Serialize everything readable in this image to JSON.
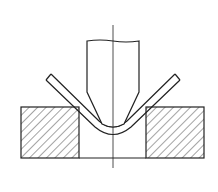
{
  "diagram": {
    "type": "technical-drawing",
    "components": [
      {
        "id": "punch",
        "label": "punch"
      },
      {
        "id": "sheet",
        "label": "bent sheet metal"
      },
      {
        "id": "die-left",
        "label": "die block (left)",
        "fill": "hatched"
      },
      {
        "id": "die-right",
        "label": "die block (right)",
        "fill": "hatched"
      },
      {
        "id": "centerline",
        "label": "center axis"
      }
    ],
    "colors": {
      "line": "#222222",
      "background": "#ffffff"
    }
  }
}
